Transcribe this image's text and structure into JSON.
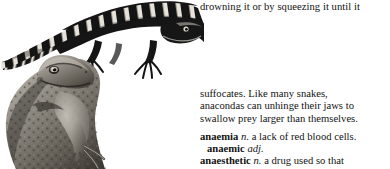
{
  "page": {
    "kind": "scanned-dictionary-page-fragment",
    "background_color": "#ffffff",
    "ink_color": "#121212"
  },
  "text_column": {
    "runon_line": "drowning it or by squeezing it until it",
    "continued_paragraph": {
      "lines": [
        "suffocates. Like many snakes,",
        "anacondas can unhinge their jaws to",
        "swallow prey larger than themselves."
      ]
    },
    "entries": [
      {
        "headword": "anaemia",
        "pos": "n.",
        "definition": "a lack of red blood cells.",
        "indented": false
      },
      {
        "headword": "anaemic",
        "pos": "adj.",
        "definition": "",
        "indented": true
      },
      {
        "headword": "anaesthetic",
        "pos": "n.",
        "definition": "a drug used so that",
        "indented": false
      }
    ]
  },
  "illustration": {
    "caption_absent": true,
    "subjects": [
      {
        "name": "banded-lizard",
        "description": "long banded salamander-like lizard arching across the top, tail curving to the left, four clawed feet"
      },
      {
        "name": "toad",
        "description": "warty toad in three-quarter profile at lower left, head raised, cropped by the bottom edge"
      }
    ],
    "style": "black-and-white engraving halftone"
  }
}
